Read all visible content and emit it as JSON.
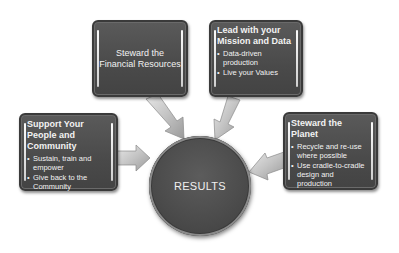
{
  "diagram": {
    "center": {
      "label": "RESULTS"
    },
    "nodes": [
      {
        "id": "financial",
        "title": "Steward the Financial Resources",
        "title_line1": "Steward the",
        "title_line2": "Financial Resources",
        "bullets": []
      },
      {
        "id": "mission",
        "title": "Lead with your Mission and Data",
        "bullets": [
          "Data-driven production",
          "Live your Values"
        ]
      },
      {
        "id": "people",
        "title": "Support Your People and Community",
        "bullets": [
          "Sustain, train and empower",
          "Give back to the Community"
        ]
      },
      {
        "id": "planet",
        "title": "Steward the Planet",
        "bullets": [
          "Recycle and re-use where possible",
          "Use cradle-to-cradle design and production"
        ]
      }
    ],
    "edges": [
      {
        "from": "financial",
        "to": "center"
      },
      {
        "from": "mission",
        "to": "center"
      },
      {
        "from": "people",
        "to": "center"
      },
      {
        "from": "planet",
        "to": "center"
      }
    ],
    "colors": {
      "box_fill": "#4a4a4a",
      "arrow_fill": "#c8c8c8",
      "text": "#f2f2f2",
      "background": "#ffffff"
    }
  }
}
